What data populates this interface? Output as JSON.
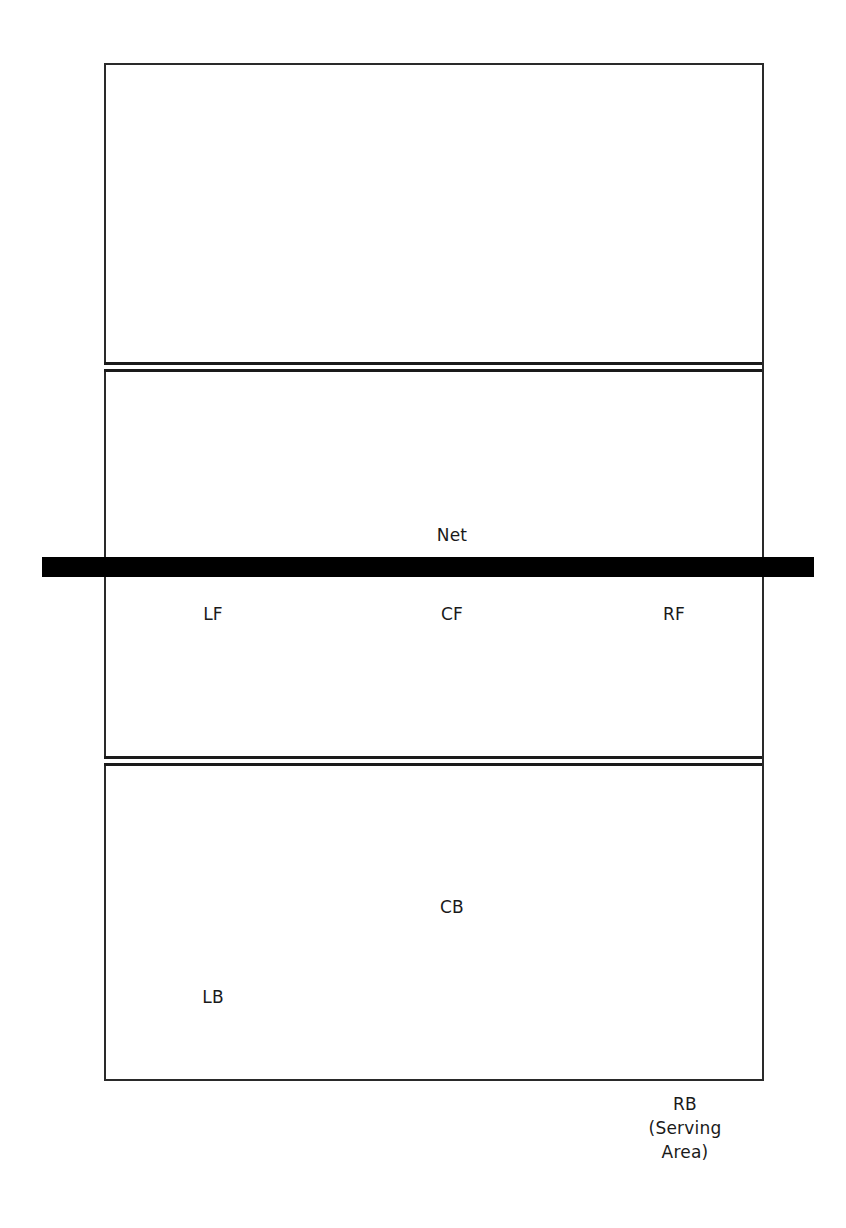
{
  "diagram": {
    "colors": {
      "background": "#ffffff",
      "lines": "#1a1a1a",
      "net": "#000000"
    },
    "net": {
      "label": "Net"
    },
    "positions": {
      "front_row": [
        {
          "id": "LF",
          "label": "LF"
        },
        {
          "id": "CF",
          "label": "CF"
        },
        {
          "id": "RF",
          "label": "RF"
        }
      ],
      "back_row": [
        {
          "id": "CB",
          "label": "CB"
        },
        {
          "id": "LB",
          "label": "LB"
        }
      ],
      "serving": {
        "id": "RB",
        "label": "RB\n(Serving\nArea)"
      }
    }
  }
}
